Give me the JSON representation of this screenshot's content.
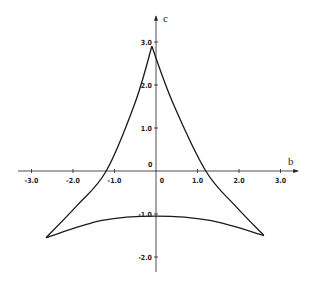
{
  "chart_data": {
    "type": "line",
    "title": "",
    "xlabel": "b",
    "ylabel": "c",
    "xlim": [
      -3.3,
      3.4
    ],
    "ylim": [
      -2.4,
      3.4
    ],
    "grid": false,
    "legend": null,
    "x_ticks": [
      -3.0,
      -2.0,
      -1.0,
      0,
      1.0,
      2.0,
      3.0
    ],
    "x_tick_labels": [
      "-3.0",
      "-2.0",
      "-1.0",
      "0",
      "1.0",
      "2.0",
      "3.0"
    ],
    "y_ticks": [
      3.0,
      2.0,
      1.0,
      0,
      -1.0,
      -2.0
    ],
    "y_tick_labels": [
      "3.0",
      "2.0",
      "1.0",
      "0",
      "-1.0",
      "-2.0"
    ],
    "series": [
      {
        "name": "curvilinear triangle (deltoid-like curve)",
        "cusps": [
          [
            -0.1,
            2.9
          ],
          [
            -2.65,
            -1.55
          ],
          [
            2.6,
            -1.5
          ]
        ],
        "left_branch": [
          [
            -0.1,
            2.9
          ],
          [
            -0.5,
            1.6
          ],
          [
            -1.2,
            0.0
          ],
          [
            -1.9,
            -0.8
          ],
          [
            -2.65,
            -1.55
          ]
        ],
        "right_branch": [
          [
            -0.1,
            2.9
          ],
          [
            0.4,
            1.6
          ],
          [
            1.2,
            0.0
          ],
          [
            1.9,
            -0.8
          ],
          [
            2.6,
            -1.5
          ]
        ],
        "bottom_branch": [
          [
            -2.65,
            -1.55
          ],
          [
            -1.3,
            -1.15
          ],
          [
            0.0,
            -1.05
          ],
          [
            1.3,
            -1.15
          ],
          [
            2.6,
            -1.5
          ]
        ]
      }
    ]
  },
  "labels": {
    "x_axis": "b",
    "y_axis": "c",
    "origin_upper": "0",
    "origin_lower": "0"
  }
}
